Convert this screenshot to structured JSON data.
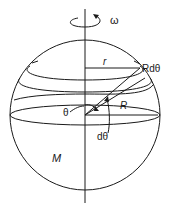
{
  "figure": {
    "labels": {
      "omega": "ω",
      "r": "r",
      "rdtheta": "Rdθ",
      "theta": "θ",
      "R": "R",
      "dtheta": "dθ",
      "M": "M"
    },
    "colors": {
      "stroke": "#1a1a1a",
      "background": "#ffffff"
    }
  }
}
